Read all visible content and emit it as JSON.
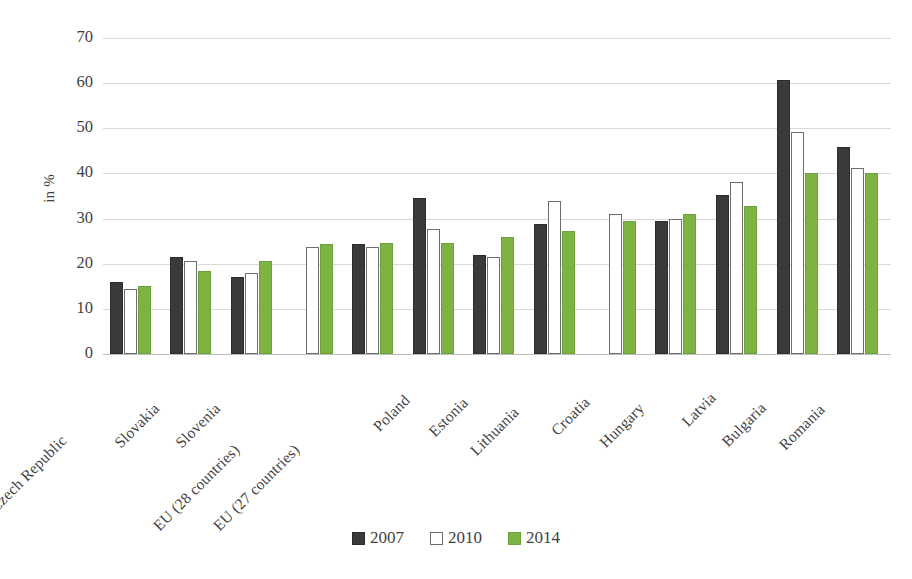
{
  "chart_data": {
    "type": "bar",
    "title": "",
    "subtitle": "",
    "xlabel": "",
    "ylabel": "in %",
    "ylim": [
      0,
      70
    ],
    "ytick_step": 10,
    "yticks": [
      "70",
      "60",
      "50",
      "40",
      "30",
      "20",
      "10",
      "0"
    ],
    "grid": true,
    "legend_position": "bottom-center",
    "categories": [
      "Czech Republic",
      "Slovakia",
      "Slovenia",
      "EU (28 countries)",
      "EU (27 countries)",
      "Poland",
      "Estonia",
      "Lithuania",
      "Croatia",
      "Hungary",
      "Latvia",
      "Bulgaria",
      "Romania"
    ],
    "series": [
      {
        "name": "2007",
        "color": "#3c3a38",
        "values": [
          16.0,
          21.5,
          17.0,
          null,
          24.4,
          34.5,
          22.0,
          28.7,
          null,
          29.4,
          35.2,
          60.7,
          45.9
        ]
      },
      {
        "name": "2010",
        "color": "#ffffff",
        "values": [
          14.5,
          20.5,
          18.0,
          23.7,
          23.7,
          27.8,
          21.5,
          34.0,
          31.1,
          29.9,
          38.0,
          49.2,
          41.2
        ]
      },
      {
        "name": "2014",
        "color": "#7cb342",
        "values": [
          15.0,
          18.5,
          20.5,
          24.4,
          24.5,
          24.7,
          26.0,
          27.3,
          29.4,
          31.1,
          32.7,
          40.1,
          40.2
        ]
      }
    ]
  },
  "legend": {
    "items": [
      {
        "label": "2007",
        "key": "y2007"
      },
      {
        "label": "2010",
        "key": "y2010"
      },
      {
        "label": "2014",
        "key": "y2014"
      }
    ]
  },
  "colors": {
    "series_2007": "#3c3a38",
    "series_2010": "#ffffff",
    "series_2014": "#7cb342",
    "gridline": "#d9d9d9",
    "axis_text": "#3f3f3f",
    "background": "#ffffff"
  }
}
